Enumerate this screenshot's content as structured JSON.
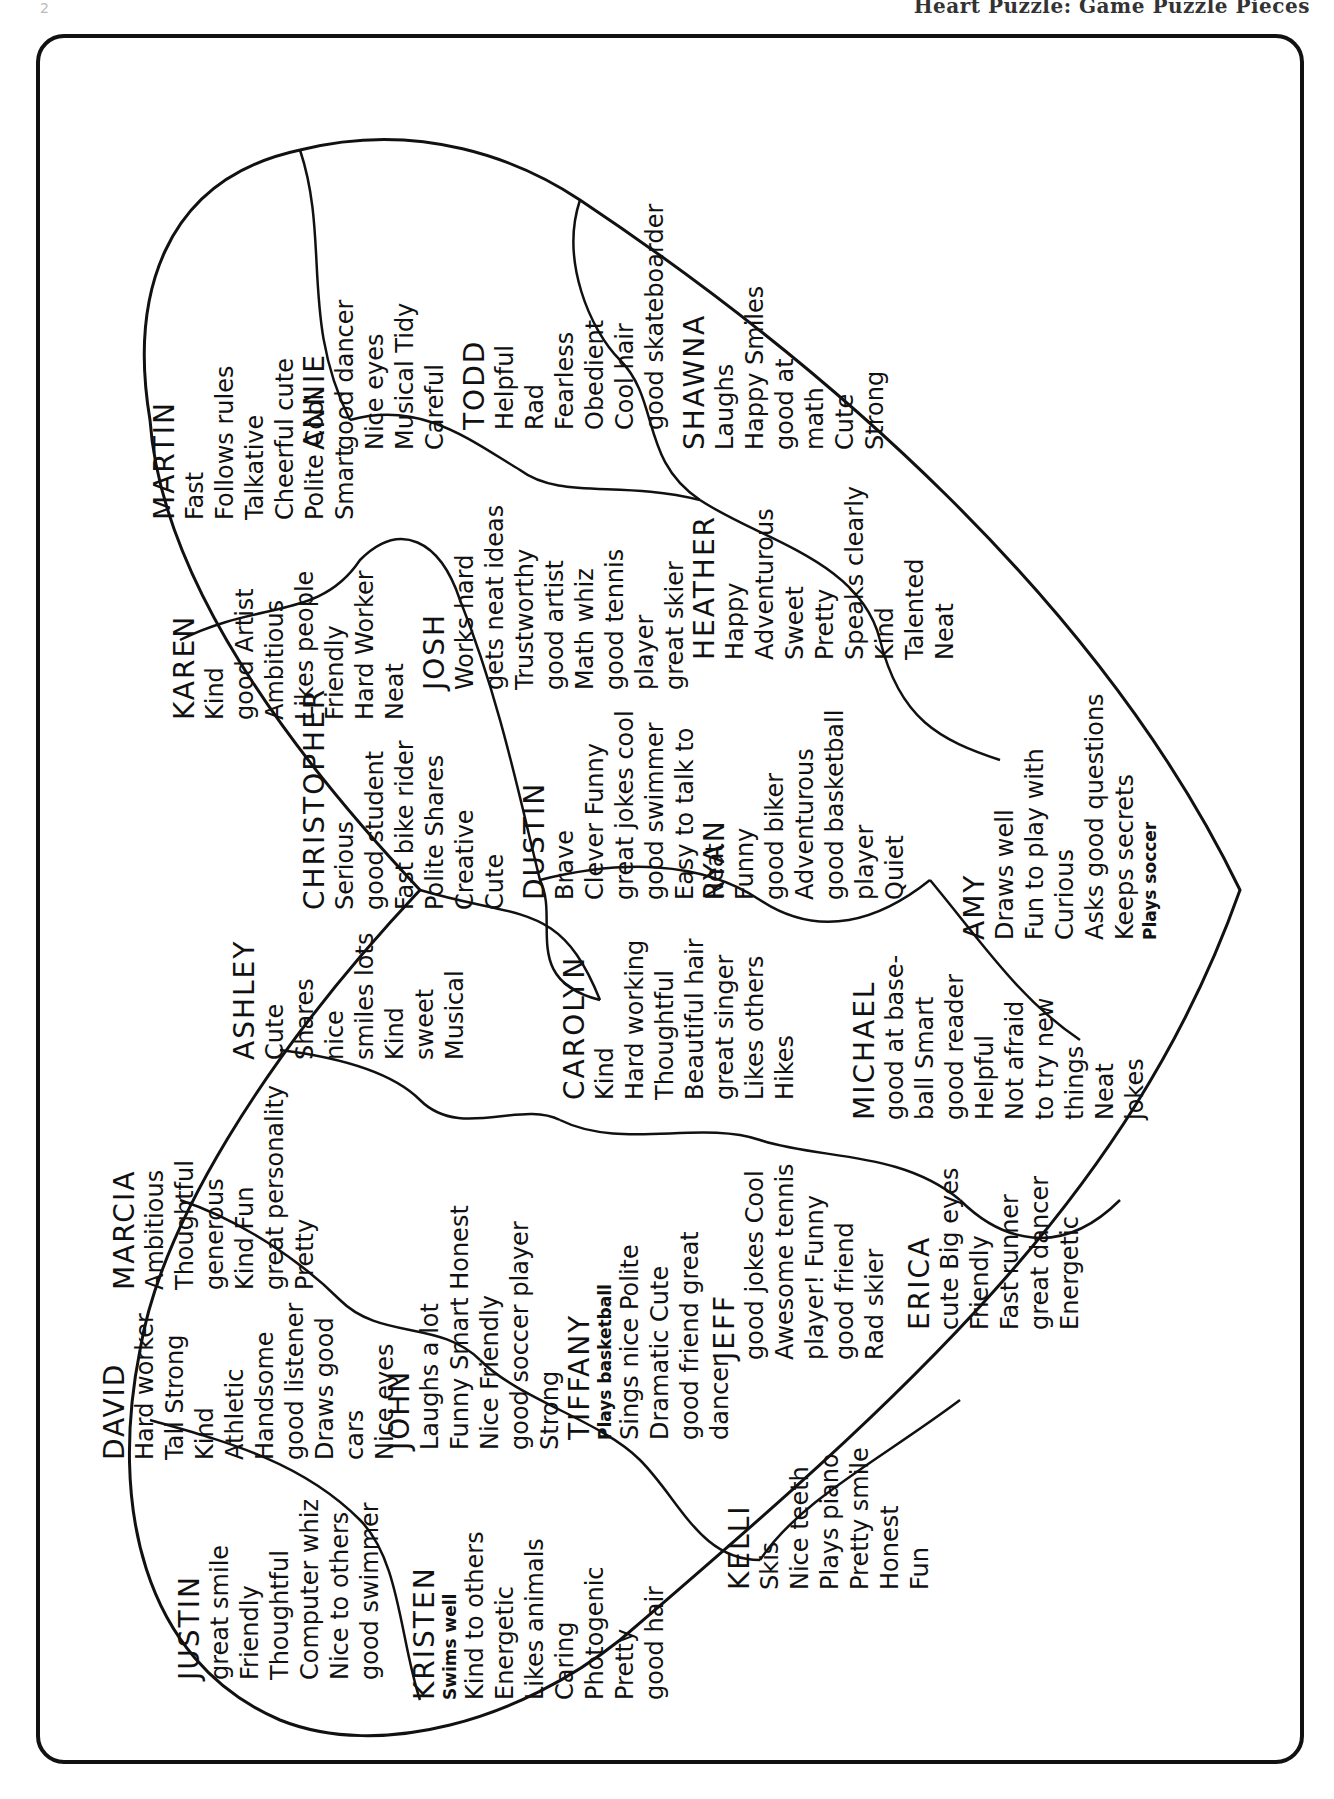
{
  "header": {
    "page_number": "2",
    "title": "Heart Puzzle: Game Puzzle Pieces"
  },
  "puzzle": {
    "shape": "heart",
    "orientation": "rotated 90 degrees counter-clockwise",
    "pieces": [
      {
        "name": "MARTIN",
        "traits": [
          "Fast",
          "Follows rules",
          "Talkative",
          "Cheerful  cute",
          "Polite   Cool",
          "Smart"
        ]
      },
      {
        "name": "ANNIE",
        "traits": [
          "good dancer",
          "Nice eyes",
          "Musical  Tidy",
          "Careful"
        ]
      },
      {
        "name": "TODD",
        "traits": [
          "Helpful",
          "Rad",
          "Fearless",
          "Obedient",
          "Cool hair",
          "good skateboarder"
        ]
      },
      {
        "name": "SHAWNA",
        "traits": [
          "Laughs",
          "Happy  Smiles",
          "good at",
          "math",
          "Cute",
          "Strong"
        ]
      },
      {
        "name": "KAREN",
        "traits": [
          "Kind",
          "good Artist",
          "Ambitious",
          "Likes people",
          "Friendly",
          "Hard Worker",
          "Neat"
        ]
      },
      {
        "name": "JOSH",
        "traits": [
          "Works hard",
          "gets neat ideas",
          "Trustworthy",
          "good artist",
          "Math whiz",
          "good tennis",
          "player",
          "great skier"
        ]
      },
      {
        "name": "HEATHER",
        "traits": [
          "Happy",
          "Adventurous",
          "Sweet",
          "Pretty",
          "Speaks clearly",
          "Kind",
          "Talented",
          "Neat"
        ]
      },
      {
        "name": "CHRISTOPHER",
        "traits": [
          "Serious",
          "good student",
          "Fast bike rider",
          "Polite  Shares",
          "Creative",
          "Cute"
        ]
      },
      {
        "name": "DUSTIN",
        "traits": [
          "Brave",
          "Clever  Funny",
          "great jokes  cool",
          "good swimmer",
          "Easy to talk to",
          "Neat"
        ]
      },
      {
        "name": "RYAN",
        "traits": [
          "Funny",
          "good biker",
          "Adventurous",
          "good basketball",
          "player",
          "Quiet"
        ]
      },
      {
        "name": "AMY",
        "traits": [
          "Draws well",
          "Fun to play with",
          "Curious",
          "Asks good questions",
          "Keeps secrets",
          "Plays soccer"
        ]
      },
      {
        "name": "ASHLEY",
        "traits": [
          "Cute",
          "Shares",
          "nice",
          "smiles lots",
          "Kind",
          "sweet",
          "Musical"
        ]
      },
      {
        "name": "CAROLYN",
        "traits": [
          "Kind",
          "Hard working",
          "Thoughtful",
          "Beautiful hair",
          "great singer",
          "Likes others",
          "Hikes"
        ]
      },
      {
        "name": "MICHAEL",
        "traits": [
          "good at base-",
          "ball   Smart",
          "good reader",
          "Helpful",
          "Not afraid",
          "to try new",
          "things",
          "Neat",
          "jokes"
        ]
      },
      {
        "name": "MARCIA",
        "traits": [
          "Ambitious",
          "Thoughtful",
          "generous",
          "Kind   Fun",
          "great personality",
          "Pretty"
        ]
      },
      {
        "name": "JOHN",
        "traits": [
          "Laughs a lot",
          "Funny  Smart  Honest",
          "Nice  Friendly",
          "good soccer player",
          "Strong"
        ]
      },
      {
        "name": "TIFFANY",
        "traits": [
          "Plays basketball",
          "Sings nice  Polite",
          "Dramatic  Cute",
          "good friend  great",
          "dancer"
        ]
      },
      {
        "name": "JEFF",
        "traits": [
          "good jokes  Cool",
          "Awesome tennis",
          "player!  Funny",
          "good friend",
          "Rad skier"
        ]
      },
      {
        "name": "ERICA",
        "traits": [
          "cute  Big eyes",
          "Friendly",
          "Fast runner",
          "great dancer",
          "Energetic"
        ]
      },
      {
        "name": "DAVID",
        "traits": [
          "Hard worker",
          "Tall   Strong",
          "Kind",
          "Athletic",
          "Handsome",
          "good listener",
          "Draws good",
          "cars",
          "Nice eyes"
        ]
      },
      {
        "name": "JUSTIN",
        "traits": [
          "great smile",
          "Friendly",
          "Thoughtful",
          "Computer whiz",
          "Nice to others",
          "good swimmer"
        ]
      },
      {
        "name": "KRISTEN",
        "traits": [
          "Swims well",
          "Kind to others",
          "Energetic",
          "Likes animals",
          "Caring",
          "Photogenic",
          "Pretty",
          "good hair"
        ]
      },
      {
        "name": "KELLI",
        "traits": [
          "Skis",
          "Nice teeth",
          "Plays piano",
          "Pretty smile",
          "Honest",
          "Fun"
        ]
      }
    ]
  },
  "colors": {
    "ink": "#111111",
    "paper": "#ffffff"
  }
}
